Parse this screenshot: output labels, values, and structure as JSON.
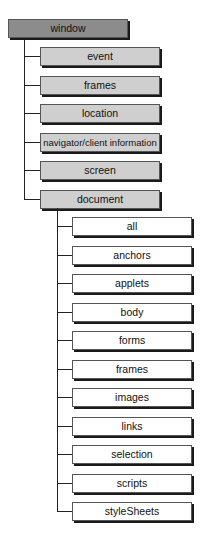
{
  "diagram": {
    "root": {
      "label": "window",
      "color": "#8c8c8c"
    },
    "children": [
      {
        "label": "event"
      },
      {
        "label": "frames"
      },
      {
        "label": "location"
      },
      {
        "label": "navigator/client information"
      },
      {
        "label": "screen"
      },
      {
        "label": "document"
      }
    ],
    "document_children": [
      {
        "label": "all"
      },
      {
        "label": "anchors"
      },
      {
        "label": "applets"
      },
      {
        "label": "body"
      },
      {
        "label": "forms"
      },
      {
        "label": "frames"
      },
      {
        "label": "images"
      },
      {
        "label": "links"
      },
      {
        "label": "selection"
      },
      {
        "label": "scripts"
      },
      {
        "label": "styleSheets"
      }
    ],
    "colors": {
      "root": "#8c8c8c",
      "level2": "#cfcfcf",
      "level3": "#ffffff",
      "line": "#222222"
    }
  }
}
